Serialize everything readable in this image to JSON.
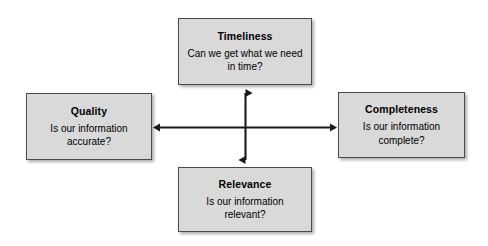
{
  "diagram": {
    "type": "four-quadrant-cross-diagram",
    "canvas": {
      "width": 488,
      "height": 246,
      "background_color": "#ffffff"
    },
    "style": {
      "box_fill_color": "#d9d9d9",
      "box_border_color": "#4a4a4a",
      "text_color": "#000000",
      "arrow_color": "#1a1a1a",
      "shadow_color": "#00000054"
    },
    "nodes": [
      {
        "id": "timeliness",
        "title": "Timeliness",
        "question": "Can we get what we need in time?",
        "position": "top"
      },
      {
        "id": "quality",
        "title": "Quality",
        "question": "Is our information accurate?",
        "position": "left"
      },
      {
        "id": "completeness",
        "title": "Completeness",
        "question": "Is our information complete?",
        "position": "right"
      },
      {
        "id": "relevance",
        "title": "Relevance",
        "question": "Is our information relevant?",
        "position": "bottom"
      }
    ],
    "connectors": [
      {
        "id": "horizontal-arrow",
        "from": "quality",
        "to": "completeness",
        "style": "double-headed",
        "orientation": "horizontal"
      },
      {
        "id": "vertical-arrow",
        "from": "timeliness",
        "to": "relevance",
        "style": "double-headed",
        "orientation": "vertical"
      }
    ]
  }
}
